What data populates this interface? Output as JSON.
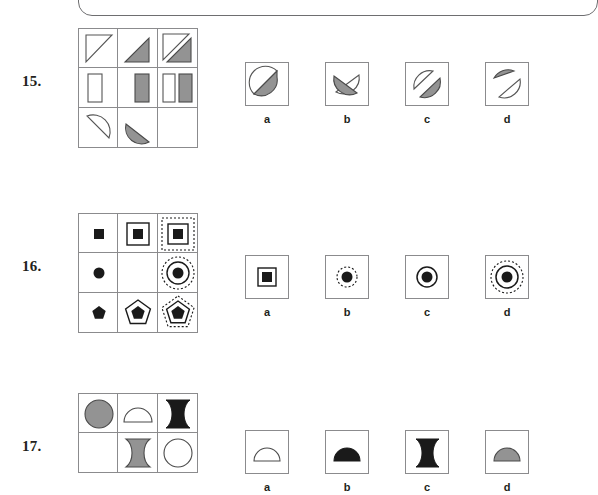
{
  "page": {
    "frame_color": "#6e6e70",
    "grid_line_color": "#8b8b8d",
    "fill_gray": "#939393",
    "fill_black": "#1a1a1a",
    "ink_color": "#231f20"
  },
  "questions": [
    {
      "number": "15.",
      "matrix": {
        "rows": 3,
        "cols": 3,
        "cells": [
          {
            "shape": "triangle-outline",
            "fill": "white",
            "note": "right triangle, hypotenuse top-left to bottom-right"
          },
          {
            "shape": "triangle-filled",
            "fill": "gray",
            "note": "right triangle gray filled"
          },
          {
            "shape": "triangle-pair",
            "fill": "outline+gray",
            "note": "outline triangle overlapped by gray triangle"
          },
          {
            "shape": "rectangle-outline",
            "fill": "white",
            "note": "tall rectangle outline"
          },
          {
            "shape": "rectangle-filled",
            "fill": "gray",
            "note": "tall rectangle gray filled"
          },
          {
            "shape": "rectangle-pair",
            "fill": "outline+gray",
            "note": "white rectangle beside gray rectangle"
          },
          {
            "shape": "halfdisc-outline",
            "fill": "white",
            "note": "half disc outline"
          },
          {
            "shape": "halfdisc-filled",
            "fill": "gray",
            "note": "half disc gray filled"
          },
          {
            "shape": "empty",
            "fill": "none",
            "note": "missing cell to be solved"
          }
        ]
      },
      "options": [
        {
          "label": "a",
          "name": "split-circle-gray-upper-right"
        },
        {
          "label": "b",
          "name": "split-circle-gray-lower-left"
        },
        {
          "label": "c",
          "name": "split-circle-gray-lower-right"
        },
        {
          "label": "d",
          "name": "split-circle-gray-upper-left"
        }
      ]
    },
    {
      "number": "16.",
      "matrix": {
        "rows": 3,
        "cols": 3,
        "cells": [
          {
            "shape": "square-filled",
            "fill": "black",
            "note": "small filled square"
          },
          {
            "shape": "square-filled-in-square",
            "fill": "black",
            "note": "filled square in solid square outline"
          },
          {
            "shape": "square-filled-in-square-in-dotted-square",
            "fill": "black",
            "note": "filled square, solid square, dotted square"
          },
          {
            "shape": "circle-filled",
            "fill": "black",
            "note": "small filled circle"
          },
          {
            "shape": "empty",
            "fill": "none",
            "note": "missing cell to be solved"
          },
          {
            "shape": "circle-filled-in-circle-in-dotted-circle",
            "fill": "black",
            "note": "filled circle, solid circle, dotted circle"
          },
          {
            "shape": "pentagon-filled",
            "fill": "black",
            "note": "small filled pentagon"
          },
          {
            "shape": "pentagon-filled-in-pentagon",
            "fill": "black",
            "note": "filled pentagon in solid pentagon outline"
          },
          {
            "shape": "pentagon-filled-in-pentagon-in-dotted-pentagon",
            "fill": "black",
            "note": "filled pentagon, solid pentagon, dotted pentagon"
          }
        ]
      },
      "options": [
        {
          "label": "a",
          "name": "filled-square-in-square"
        },
        {
          "label": "b",
          "name": "filled-circle-in-dotted-circle"
        },
        {
          "label": "c",
          "name": "filled-circle-in-solid-circle"
        },
        {
          "label": "d",
          "name": "filled-circle-in-circle-in-dotted-circle"
        }
      ]
    },
    {
      "number": "17.",
      "matrix": {
        "rows": 2,
        "cols": 3,
        "cells": [
          {
            "shape": "circle-filled",
            "fill": "gray",
            "note": "gray filled circle"
          },
          {
            "shape": "halfdisc-outline",
            "fill": "white",
            "note": "half disc outline, flat side down"
          },
          {
            "shape": "wave-filled",
            "fill": "black",
            "note": "black curved wave shape"
          },
          {
            "shape": "empty",
            "fill": "none",
            "note": "empty cell"
          },
          {
            "shape": "wave-filled",
            "fill": "gray",
            "note": "gray curved wave shape"
          },
          {
            "shape": "circle-outline",
            "fill": "white",
            "note": "circle outline"
          }
        ]
      },
      "options": [
        {
          "label": "a",
          "name": "halfdisc-outline"
        },
        {
          "label": "b",
          "name": "halfdisc-black-filled"
        },
        {
          "label": "c",
          "name": "wave-black-filled"
        },
        {
          "label": "d",
          "name": "halfdisc-gray-filled"
        }
      ]
    }
  ]
}
